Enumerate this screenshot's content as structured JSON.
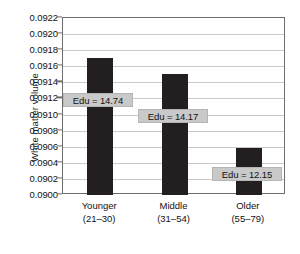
{
  "chart_data": {
    "type": "bar",
    "title": "",
    "xlabel": "",
    "ylabel": "White matter volume",
    "ylim": [
      0.09,
      0.0922
    ],
    "ytick_step": 0.0002,
    "grid": true,
    "legend": "none",
    "bar_color": "#231f20",
    "annotation_box_color": "#c9c9c9",
    "categories": [
      "Younger",
      "Middle",
      "Older"
    ],
    "category_subtitles": [
      "(21–30)",
      "(31–54)",
      "(55–79)"
    ],
    "values": [
      0.0917,
      0.0915,
      0.09058
    ],
    "annotations": [
      "Edu = 14.74",
      "Edu = 14.17",
      "Edu = 12.15"
    ],
    "ytick_labels": [
      "0.0922",
      "0.0920",
      "0.0918",
      "0.0916",
      "0.0914",
      "0.0912",
      "0.0910",
      "0.0908",
      "0.0906",
      "0.0904",
      "0.0902",
      "0.0900"
    ],
    "ytick_values": [
      0.0922,
      0.092,
      0.0918,
      0.0916,
      0.0914,
      0.0912,
      0.091,
      0.0908,
      0.0906,
      0.0904,
      0.0902,
      0.09
    ]
  }
}
